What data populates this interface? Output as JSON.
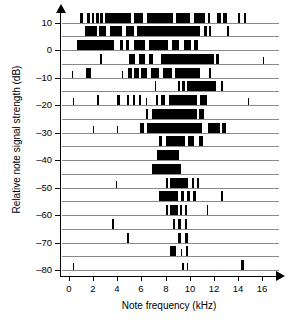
{
  "chart_data": {
    "type": "bar",
    "title": "",
    "xlabel": "Note frequency (kHz)",
    "ylabel": "Relative note signal strength (dB)",
    "xlim": [
      -0.6,
      17.4
    ],
    "ylim": [
      -83,
      13
    ],
    "xticks": [
      0,
      2,
      4,
      6,
      8,
      10,
      12,
      14,
      16
    ],
    "xticklabels": [
      "0",
      "2",
      "4",
      "6",
      "8",
      "10",
      "12",
      "14",
      "16"
    ],
    "yticks": [
      10,
      0,
      -10,
      -20,
      -30,
      -40,
      -50,
      -60,
      -70,
      -80
    ],
    "yticklabels": [
      "10",
      "0",
      "-10",
      "-20",
      "-30",
      "-40",
      "-50",
      "-60",
      "-70",
      "-80"
    ],
    "grid": false,
    "legend": null,
    "row_step_db": 5,
    "rows": [
      {
        "level": 10,
        "segments": [
          [
            0.9,
            1.2
          ],
          [
            1.5,
            1.7
          ],
          [
            1.9,
            2.1
          ],
          [
            2.2,
            2.45
          ],
          [
            2.6,
            2.8
          ],
          [
            2.95,
            5.1
          ],
          [
            5.4,
            6.1
          ],
          [
            6.5,
            8.6
          ],
          [
            8.9,
            10.0
          ],
          [
            10.4,
            11.3
          ],
          [
            11.5,
            11.7
          ],
          [
            12.3,
            12.6
          ],
          [
            12.8,
            13.1
          ],
          [
            14.0,
            14.2
          ],
          [
            14.5,
            14.7
          ]
        ]
      },
      {
        "level": 5,
        "segments": [
          [
            1.3,
            2.3
          ],
          [
            2.5,
            3.1
          ],
          [
            3.4,
            4.4
          ],
          [
            4.7,
            5.4
          ],
          [
            5.6,
            10.9
          ],
          [
            11.2,
            11.4
          ],
          [
            11.6,
            11.8
          ],
          [
            13.1,
            13.25
          ]
        ]
      },
      {
        "level": 0,
        "segments": [
          [
            0.7,
            3.7
          ],
          [
            4.2,
            4.5
          ],
          [
            4.7,
            5.0
          ],
          [
            5.4,
            6.3
          ],
          [
            6.6,
            8.2
          ],
          [
            8.5,
            9.1
          ],
          [
            9.5,
            10.1
          ],
          [
            10.4,
            10.7
          ]
        ]
      },
      {
        "level": -5,
        "segments": [
          [
            2.6,
            2.75
          ],
          [
            5.0,
            5.5
          ],
          [
            5.8,
            6.3
          ],
          [
            6.6,
            7.0
          ],
          [
            7.6,
            12.0
          ],
          [
            12.2,
            12.4
          ],
          [
            16.1,
            16.2
          ]
        ]
      },
      {
        "level": -10,
        "segments": [
          [
            0.25,
            0.35
          ],
          [
            1.4,
            1.8
          ],
          [
            4.4,
            4.5
          ],
          [
            4.9,
            5.2
          ],
          [
            5.4,
            5.8
          ],
          [
            6.0,
            6.5
          ],
          [
            6.8,
            7.5
          ],
          [
            7.8,
            8.5
          ],
          [
            8.8,
            10.9
          ],
          [
            11.6,
            11.8
          ]
        ]
      },
      {
        "level": -15,
        "segments": [
          [
            7.1,
            7.25
          ],
          [
            9.0,
            9.2
          ],
          [
            9.4,
            9.6
          ],
          [
            9.8,
            12.2
          ],
          [
            12.6,
            12.75
          ]
        ]
      },
      {
        "level": -20,
        "segments": [
          [
            0.3,
            0.4
          ],
          [
            2.3,
            2.45
          ],
          [
            4.0,
            4.2
          ],
          [
            4.8,
            5.0
          ],
          [
            5.3,
            5.5
          ],
          [
            5.8,
            6.0
          ],
          [
            6.4,
            6.5
          ],
          [
            7.2,
            7.4
          ],
          [
            7.6,
            8.0
          ],
          [
            8.3,
            10.6
          ],
          [
            10.9,
            11.4
          ],
          [
            14.8,
            14.9
          ]
        ]
      },
      {
        "level": -25,
        "segments": [
          [
            6.4,
            6.55
          ],
          [
            6.9,
            10.6
          ],
          [
            10.8,
            11.2
          ]
        ]
      },
      {
        "level": -30,
        "segments": [
          [
            2.0,
            2.1
          ],
          [
            4.0,
            4.1
          ],
          [
            5.9,
            6.2
          ],
          [
            6.5,
            11.0
          ],
          [
            11.5,
            12.5
          ],
          [
            12.7,
            13.0
          ]
        ]
      },
      {
        "level": -35,
        "segments": [
          [
            7.5,
            7.7
          ],
          [
            8.0,
            9.6
          ],
          [
            9.9,
            10.4
          ],
          [
            10.8,
            11.1
          ]
        ]
      },
      {
        "level": -40,
        "segments": [
          [
            7.3,
            9.1
          ]
        ]
      },
      {
        "level": -45,
        "segments": [
          [
            6.9,
            9.3
          ]
        ]
      },
      {
        "level": -50,
        "segments": [
          [
            3.9,
            4.0
          ],
          [
            8.0,
            8.2
          ],
          [
            8.4,
            9.9
          ],
          [
            10.2,
            10.4
          ],
          [
            10.6,
            10.8
          ]
        ]
      },
      {
        "level": -55,
        "segments": [
          [
            7.5,
            9.0
          ],
          [
            9.3,
            9.5
          ],
          [
            9.8,
            10.0
          ],
          [
            10.3,
            10.5
          ],
          [
            12.6,
            12.75
          ]
        ]
      },
      {
        "level": -60,
        "segments": [
          [
            8.0,
            8.2
          ],
          [
            8.4,
            9.0
          ],
          [
            9.2,
            9.4
          ],
          [
            9.6,
            9.8
          ],
          [
            11.4,
            11.55
          ]
        ]
      },
      {
        "level": -65,
        "segments": [
          [
            3.6,
            3.75
          ],
          [
            8.6,
            8.8
          ],
          [
            9.0,
            9.3
          ],
          [
            9.6,
            9.8
          ]
        ]
      },
      {
        "level": -70,
        "segments": [
          [
            4.8,
            4.95
          ],
          [
            9.0,
            9.3
          ],
          [
            9.6,
            9.9
          ]
        ]
      },
      {
        "level": -75,
        "segments": [
          [
            8.4,
            8.9
          ],
          [
            9.3,
            9.4
          ],
          [
            9.7,
            9.9
          ]
        ]
      },
      {
        "level": -80,
        "segments": [
          [
            0.3,
            0.38
          ],
          [
            9.4,
            9.5
          ],
          [
            9.8,
            9.9
          ],
          [
            14.3,
            14.5
          ]
        ]
      }
    ]
  }
}
